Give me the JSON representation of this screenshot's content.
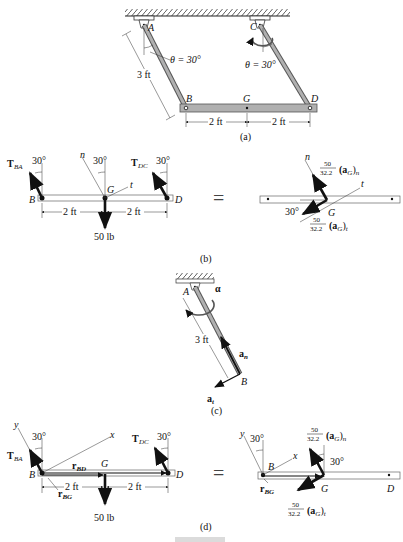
{
  "figure": {
    "caption_partial": "Fig. 17-8 (cut off)",
    "panels": {
      "a": {
        "label": "(a)",
        "points": [
          "A",
          "B",
          "C",
          "D",
          "G"
        ],
        "angle_left": "θ = 30°",
        "angle_right": "θ = 30°",
        "link_length": "3 ft",
        "dim_left": "2 ft",
        "dim_right": "2 ft"
      },
      "b": {
        "label": "(b)",
        "force_BA": "T",
        "force_BA_sub": "BA",
        "force_DC": "T",
        "force_DC_sub": "DC",
        "angle_B": "30°",
        "angle_G": "30°",
        "angle_D": "30°",
        "axis_n": "n",
        "axis_t": "t",
        "point_B": "B",
        "point_G": "G",
        "point_D": "D",
        "dim_left": "2 ft",
        "dim_right": "2 ft",
        "weight": "50 lb",
        "equals": "=",
        "kinetic": {
          "axis_n": "n",
          "axis_t": "t",
          "point_G": "G",
          "angle": "30°",
          "frac_num": "50",
          "frac_den": "32.2",
          "term_n": "(a",
          "term_n_sub": "G",
          "term_n_close": ")",
          "term_n_idx": "n",
          "term_t_idx": "t"
        }
      },
      "c": {
        "label": "(c)",
        "point_A": "A",
        "point_B": "B",
        "alpha": "α",
        "length": "3 ft",
        "a_n": "a",
        "a_n_sub": "n",
        "a_t": "a",
        "a_t_sub": "t"
      },
      "d": {
        "label": "(d)",
        "axis_x": "x",
        "axis_y": "y",
        "force_BA": "T",
        "force_BA_sub": "BA",
        "force_DC": "T",
        "force_DC_sub": "DC",
        "angle_B": "30°",
        "angle_D": "30°",
        "r_BD": "r",
        "r_BD_sub": "BD",
        "r_BG": "r",
        "r_BG_sub": "BG",
        "point_B": "B",
        "point_G": "G",
        "point_D": "D",
        "dim_left": "2 ft",
        "dim_right": "2 ft",
        "weight": "50 lb",
        "equals": "=",
        "kinetic": {
          "axis_x": "x",
          "axis_y": "y",
          "angle_B": "30°",
          "angle_G": "30°",
          "point_B": "B",
          "point_G": "G",
          "point_D": "D",
          "r_BG": "r",
          "r_BG_sub": "BG",
          "frac_num": "50",
          "frac_den": "32.2",
          "term_n_idx": "n",
          "term_t_idx": "t"
        }
      }
    },
    "colors": {
      "member_fill": "#b0b0b0",
      "member_stroke": "#555555",
      "ink": "#111111",
      "bar_outline": "#666666"
    }
  }
}
